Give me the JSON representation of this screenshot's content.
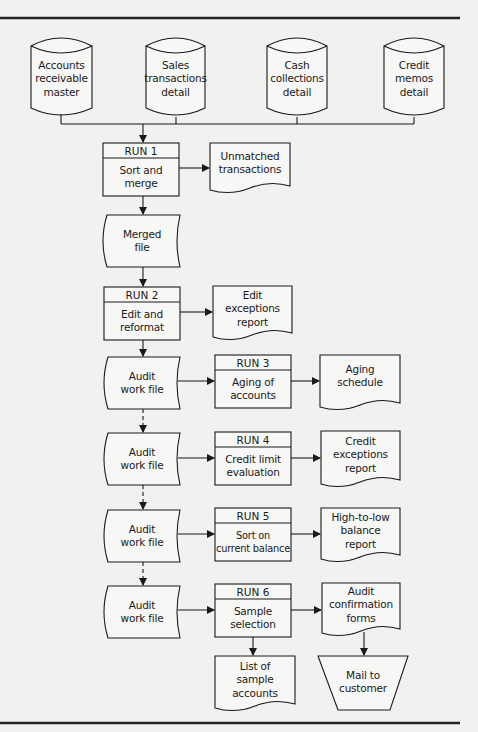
{
  "colors": {
    "background": "#f1f1ef",
    "stroke": "#1a1a1a",
    "shape_fill": "#f7f7f5",
    "rule": "#222222"
  },
  "sources": [
    {
      "label": "Accounts\nreceivable\nmaster",
      "shape": "disk"
    },
    {
      "label": "Sales\ntransactions\ndetail",
      "shape": "disk"
    },
    {
      "label": "Cash\ncollections\ndetail",
      "shape": "disk"
    },
    {
      "label": "Credit\nmemos\ndetail",
      "shape": "disk"
    }
  ],
  "runs": [
    {
      "header": "RUN 1",
      "label": "Sort and\nmerge"
    },
    {
      "header": "RUN 2",
      "label": "Edit and\nreformat"
    },
    {
      "header": "RUN 3",
      "label": "Aging of\naccounts"
    },
    {
      "header": "RUN 4",
      "label": "Credit limit\nevaluation"
    },
    {
      "header": "RUN 5",
      "label": "Sort on\ncurrent balance"
    },
    {
      "header": "RUN 6",
      "label": "Sample\nselection"
    }
  ],
  "files": {
    "merged": "Merged\nfile",
    "audit_work_file": "Audit\nwork file"
  },
  "documents": {
    "unmatched": "Unmatched\ntransactions",
    "edit_exceptions": "Edit\nexceptions\nreport",
    "aging_schedule": "Aging\nschedule",
    "credit_exceptions": "Credit\nexceptions\nreport",
    "high_to_low": "High-to-low\nbalance\nreport",
    "confirmation_forms": "Audit\nconfirmation\nforms",
    "sample_list": "List of\nsample\naccounts"
  },
  "manual_operation": {
    "label": "Mail to\ncustomer"
  }
}
